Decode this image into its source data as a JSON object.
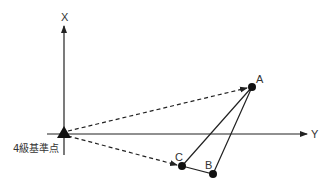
{
  "diagram": {
    "axes": {
      "x_label": "X",
      "y_label": "Y"
    },
    "origin": {
      "label": "4級基準点"
    },
    "points": [
      {
        "id": "A",
        "label": "A"
      },
      {
        "id": "B",
        "label": "B"
      },
      {
        "id": "C",
        "label": "C"
      }
    ],
    "colors": {
      "line": "#222222",
      "text": "#333333",
      "background": "#ffffff"
    }
  }
}
